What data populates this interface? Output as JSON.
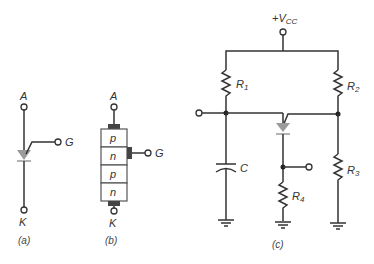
{
  "figures": {
    "a": {
      "caption": "(a)",
      "anode_label": "A",
      "gate_label": "G",
      "cathode_label": "K"
    },
    "b": {
      "caption": "(b)",
      "anode_label": "A",
      "gate_label": "G",
      "cathode_label": "K",
      "layers": [
        "p",
        "n",
        "p",
        "n"
      ]
    },
    "c": {
      "caption": "(c)",
      "supply_label": "+V",
      "supply_sub": "CC",
      "r1": {
        "main": "R",
        "sub": "1"
      },
      "r2": {
        "main": "R",
        "sub": "2"
      },
      "r3": {
        "main": "R",
        "sub": "3"
      },
      "r4": {
        "main": "R",
        "sub": "4"
      },
      "capacitor_label": "C"
    }
  },
  "colors": {
    "wire": "#333333",
    "diode": "#9a9a9a"
  }
}
